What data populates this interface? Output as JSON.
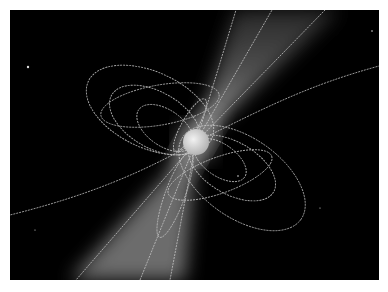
{
  "image": {
    "subject": "pulsar-illustration",
    "description": "Neutron star with dipole magnetic field lines and twin radiation beams on black space background",
    "colors": {
      "background": "#ffffff",
      "space": "#000000",
      "star": "#dcdcdc",
      "field_lines": "#bfbfbf",
      "beam": "#9a9a9a"
    },
    "star": {
      "cx": 186,
      "cy": 132,
      "r": 13
    }
  }
}
